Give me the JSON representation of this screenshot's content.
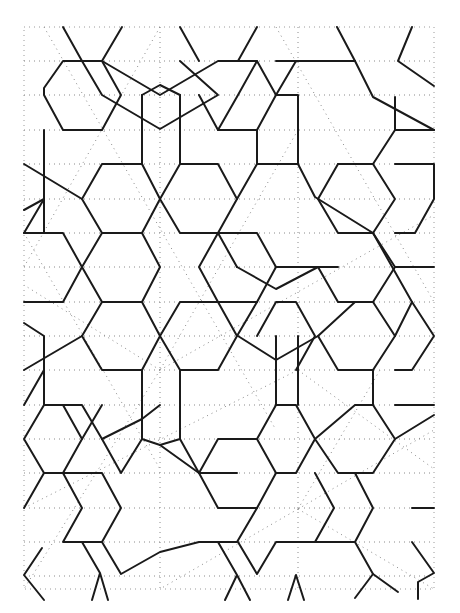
{
  "figure": {
    "title": "",
    "width": 460,
    "height": 613,
    "colors": {
      "line": "#1a1a1a",
      "guide": "#8a8a8a",
      "background": "#ffffff"
    },
    "frame": {
      "x": 24,
      "y": 27,
      "w": 410,
      "h": 562
    },
    "guides": [
      [
        24,
        61,
        434,
        61
      ],
      [
        24,
        95,
        434,
        95
      ],
      [
        24,
        130,
        434,
        130
      ],
      [
        24,
        164,
        434,
        164
      ],
      [
        24,
        199,
        434,
        199
      ],
      [
        24,
        233,
        434,
        233
      ],
      [
        24,
        267,
        434,
        267
      ],
      [
        24,
        302,
        434,
        302
      ],
      [
        24,
        336,
        434,
        336
      ],
      [
        24,
        370,
        434,
        370
      ],
      [
        24,
        405,
        434,
        405
      ],
      [
        24,
        439,
        434,
        439
      ],
      [
        24,
        473,
        434,
        473
      ],
      [
        24,
        508,
        434,
        508
      ],
      [
        24,
        542,
        434,
        542
      ],
      [
        24,
        576,
        434,
        576
      ],
      [
        160,
        27,
        160,
        589
      ],
      [
        298,
        27,
        298,
        589
      ],
      [
        44,
        27,
        276,
        430
      ],
      [
        276,
        27,
        434,
        302
      ],
      [
        24,
        233,
        160,
        469
      ],
      [
        160,
        27,
        24,
        267
      ],
      [
        298,
        130,
        160,
        370
      ],
      [
        160,
        370,
        434,
        215
      ],
      [
        24,
        508,
        298,
        370
      ],
      [
        298,
        370,
        434,
        469
      ],
      [
        160,
        370,
        24,
        285
      ],
      [
        298,
        509,
        434,
        430
      ],
      [
        160,
        370,
        24,
        589
      ],
      [
        298,
        509,
        160,
        589
      ],
      [
        298,
        509,
        434,
        589
      ],
      [
        298,
        509,
        380,
        370
      ]
    ],
    "paths": [
      "M44,88 L63,61 L102,61 L121,95 L102,130 L63,130 L44,95 Z",
      "M63,27 L82,61 L102,95 L160,129 L218,95 L180,61",
      "M122,27 L102,61",
      "M102,61 L160,95 L218,61 L257,61 L276,95 L257,130 L218,130 L199,95",
      "M180,27 L199,61",
      "M257,27 L238,61",
      "M337,27 L355,61",
      "M412,27 L398,61 L434,86",
      "M355,61 L373,97 L434,130",
      "M257,61 L238,95 L218,130",
      "M276,61 L296,61 L315,61 L355,61",
      "M296,61 L276,95",
      "M142,95 L142,164 M180,95 L180,164",
      "M142,95 L160,85 L180,95",
      "M44,130 L44,233 M24,164 L82,199",
      "M24,210 L44,199",
      "M82,199 L102,164 L142,164 L160,199 L142,233 L102,233 L82,199",
      "M160,199 L180,164 L218,164 L237,199 L218,233 L180,233 L160,199",
      "M237,199 L257,164 L257,130",
      "M102,233 L82,267 L102,302 L142,302 L160,267 L142,233",
      "M24,233 L63,233 L82,267",
      "M24,233 L44,199",
      "M218,233 L237,267",
      "M298,164 L298,95 L276,95",
      "M298,164 L257,164",
      "M298,164 L315,197 L373,233",
      "M338,164 L373,164 L395,130 L434,130",
      "M373,164 L395,199 L373,233 L338,233 L318,199 L338,164",
      "M395,164 L434,164 L434,199 L415,233 L395,233",
      "M395,130 L395,97",
      "M373,233 L412,302",
      "M218,233 L257,233 L276,267 L257,302 L218,302 L199,267 L218,233",
      "M276,267 L296,267 L338,267",
      "M237,267 L276,289 L318,267",
      "M318,267 L338,302 L373,302 L395,267 L373,233",
      "M395,267 L434,267",
      "M24,302 L63,302 L82,267",
      "M24,323 L44,336 L44,405",
      "M24,370 L82,336",
      "M82,336 L102,302",
      "M82,336 L102,370 L142,370 L160,336 L142,302",
      "M160,336 L180,302 L218,302 L237,336 L218,370 L180,370 L160,336",
      "M142,370 L142,439 L160,445 L180,439 L180,370",
      "M237,336 L257,302",
      "M257,336 L276,302 L296,302 L315,336 L296,370",
      "M238,336 L276,360 L318,336 L355,302",
      "M276,336 L276,405 M298,336 L298,405",
      "M318,336 L338,370 L373,370 L395,336 L373,302",
      "M395,336 L412,302 L434,336 L412,370 L395,370",
      "M373,370 L373,405",
      "M24,405 L44,370",
      "M44,405 L63,405 L82,439 L63,473 L44,473 L24,439 L44,405",
      "M63,405 L82,405 L102,439",
      "M82,439 L102,405",
      "M102,439 L142,419 L160,405",
      "M142,439 L121,473 L102,439",
      "M160,445 L199,473 L237,473",
      "M180,439 L199,473",
      "M199,473 L218,439 L257,439 L276,473 L257,508 L218,508 L199,473",
      "M257,439 L276,405 L296,405 L315,439 L296,473 L276,473",
      "M315,439 L355,405 L373,405 L395,439 L373,473 L338,473 L315,439",
      "M395,439 L434,415",
      "M395,405 L434,405",
      "M63,473 L82,508 L63,542 L102,542 L121,508 L102,473 L82,473 L63,473",
      "M24,508 L44,473",
      "M102,542 L121,574 L160,552 L199,542 L237,542 L257,508",
      "M238,542 L257,574 L276,542 L315,542 L334,508 L315,473",
      "M315,542 L355,542 L373,508 L355,473",
      "M355,542 L373,574 L398,592",
      "M373,574 L355,598",
      "M412,508 L434,508",
      "M412,542 L434,573 L418,582 L418,599",
      "M24,575 L42,548 M24,575 L44,600",
      "M82,542 L100,573 L108,600 M100,573 L92,600",
      "M218,542 L237,575 L225,600 M237,575 L250,600",
      "M296,575 L288,600 M296,575 L304,600"
    ]
  }
}
